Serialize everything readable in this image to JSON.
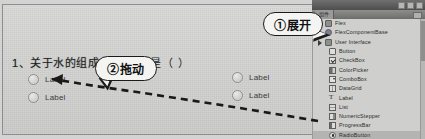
{
  "quiz": {
    "question_number": "1、",
    "question_text": "关于水的组成，",
    "question_tail": "是（  ）",
    "options_left": [
      {
        "label": "Label"
      },
      {
        "label": "Label"
      }
    ],
    "options_right": [
      {
        "label": "Label"
      },
      {
        "label": "Label"
      }
    ]
  },
  "callouts": {
    "expand": "①展开",
    "drag": "②拖动"
  },
  "panel": {
    "tab_label": "组件",
    "window_buttons": [
      "minimize",
      "maximize",
      "close"
    ],
    "tree": [
      {
        "label": "Flex",
        "icon": "folder-icon",
        "indent": 1,
        "disclosure": true,
        "selected": false
      },
      {
        "label": "FlexComponentBase",
        "icon": "component-base-icon",
        "indent": 2,
        "disclosure": false,
        "selected": false
      },
      {
        "label": "User Interface",
        "icon": "folder-icon",
        "indent": 1,
        "disclosure": true,
        "selected": false
      },
      {
        "label": "Button",
        "icon": "button-icon",
        "indent": 3,
        "disclosure": false,
        "selected": false
      },
      {
        "label": "CheckBox",
        "icon": "checkbox-icon",
        "indent": 3,
        "disclosure": false,
        "selected": false
      },
      {
        "label": "ColorPicker",
        "icon": "colorpicker-icon",
        "indent": 3,
        "disclosure": false,
        "selected": false
      },
      {
        "label": "ComboBox",
        "icon": "combobox-icon",
        "indent": 3,
        "disclosure": false,
        "selected": false
      },
      {
        "label": "DataGrid",
        "icon": "datagrid-icon",
        "indent": 3,
        "disclosure": false,
        "selected": false
      },
      {
        "label": "Label",
        "icon": "label-icon",
        "indent": 3,
        "disclosure": false,
        "selected": false
      },
      {
        "label": "List",
        "icon": "list-icon",
        "indent": 3,
        "disclosure": false,
        "selected": false
      },
      {
        "label": "NumericStepper",
        "icon": "numericstepper-icon",
        "indent": 3,
        "disclosure": false,
        "selected": false
      },
      {
        "label": "ProgressBar",
        "icon": "progressbar-icon",
        "indent": 3,
        "disclosure": false,
        "selected": false
      },
      {
        "label": "RadioButton",
        "icon": "radiobutton-icon",
        "indent": 3,
        "disclosure": false,
        "selected": true
      },
      {
        "label": "ScrollPane",
        "icon": "scrollpane-icon",
        "indent": 3,
        "disclosure": false,
        "selected": false
      }
    ]
  },
  "colors": {
    "paper": "#d3d3d1",
    "panel": "#cfcfcd",
    "selection": "#b4b4b2",
    "annotation": "#1b1b1b"
  }
}
